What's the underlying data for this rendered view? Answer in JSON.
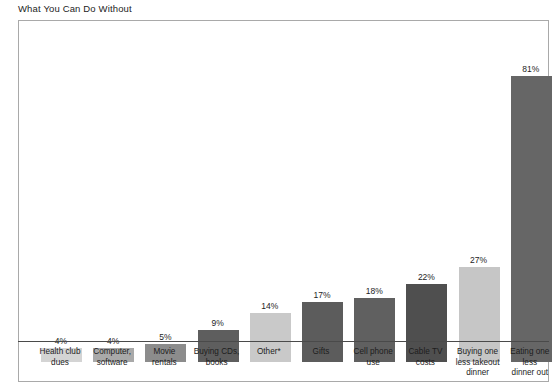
{
  "chart_data": {
    "type": "bar",
    "title": "What You Can Do Without",
    "xlabel": "",
    "ylabel": "",
    "ylim": [
      0,
      90
    ],
    "grid": false,
    "legend": null,
    "value_suffix": "%",
    "footnote_marker": "*",
    "categories": [
      "Health club dues",
      "Computer, software",
      "Movie rentals",
      "Buying CDs, books",
      "Other*",
      "Gifts",
      "Cell phone use",
      "Cable TV costs",
      "Buying one less takeout dinner",
      "Eating one less dinner out"
    ],
    "category_lines": [
      [
        "Health club",
        "dues"
      ],
      [
        "Computer,",
        "software"
      ],
      [
        "Movie",
        "rentals"
      ],
      [
        "Buying CDs,",
        "books"
      ],
      [
        "Other*"
      ],
      [
        "Gifts"
      ],
      [
        "Cell phone",
        "use"
      ],
      [
        "Cable TV",
        "costs"
      ],
      [
        "Buying one",
        "less takeout",
        "dinner"
      ],
      [
        "Eating one",
        "less",
        "dinner out"
      ]
    ],
    "values": [
      4,
      4,
      5,
      9,
      14,
      17,
      18,
      22,
      27,
      81
    ],
    "value_labels": [
      "4%",
      "4%",
      "5%",
      "9%",
      "14%",
      "17%",
      "18%",
      "22%",
      "27%",
      "81%"
    ],
    "bar_colors": [
      "#d4d4d4",
      "#a9a9a9",
      "#8c8c8c",
      "#5e5e5e",
      "#c9c9c9",
      "#5c5c5c",
      "#606060",
      "#4f4f4f",
      "#c6c6c6",
      "#666666"
    ]
  },
  "style": {
    "frame_border": "#a9a9a9",
    "axis_line": "#4a4a4a",
    "background": "#ffffff",
    "text": "#1d1d1d"
  }
}
